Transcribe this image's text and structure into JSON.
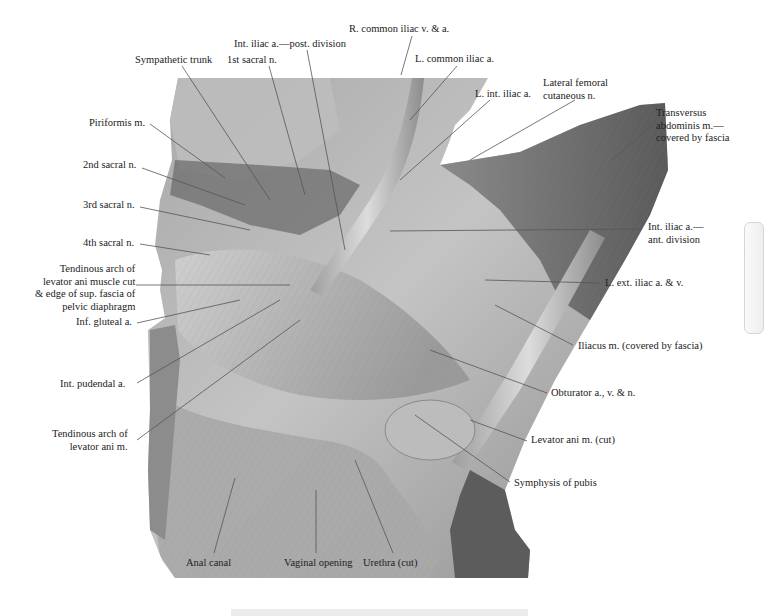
{
  "figure": {
    "colors": {
      "background": "#ffffff",
      "specimen_light": "#cfcfcf",
      "specimen_mid": "#9c9c9c",
      "specimen_dark": "#4a4a4a",
      "leader_line": "#555555",
      "label_text": "#222222",
      "side_tab_border": "#d6d6d6",
      "bottom_bar": "#ececec"
    }
  },
  "labels": [
    {
      "id": "r-common-iliac",
      "text": "R. common iliac v. & a.",
      "x": 349,
      "y": 23,
      "align": "left",
      "line": [
        [
          412,
          36
        ],
        [
          401,
          75
        ]
      ]
    },
    {
      "id": "int-iliac-post",
      "text": "Int. iliac a.—post. division",
      "x": 234,
      "y": 38,
      "align": "left",
      "line": [
        [
          307,
          50
        ],
        [
          345,
          250
        ]
      ]
    },
    {
      "id": "sympathetic-trunk",
      "text": "Sympathetic trunk",
      "x": 135,
      "y": 54,
      "align": "left",
      "line": [
        [
          182,
          66
        ],
        [
          270,
          200
        ]
      ]
    },
    {
      "id": "1st-sacral",
      "text": "1st sacral n.",
      "x": 227,
      "y": 54,
      "align": "left",
      "line": [
        [
          269,
          66
        ],
        [
          305,
          195
        ]
      ]
    },
    {
      "id": "l-common-iliac",
      "text": "L. common iliac a.",
      "x": 415,
      "y": 53,
      "align": "left",
      "line": [
        [
          457,
          66
        ],
        [
          410,
          120
        ]
      ]
    },
    {
      "id": "lat-femoral-cut",
      "text": "Lateral femoral\ncutaneous n.",
      "x": 543,
      "y": 77,
      "align": "left",
      "line": [
        [
          575,
          100
        ],
        [
          470,
          160
        ]
      ]
    },
    {
      "id": "l-int-iliac",
      "text": "L. int. iliac a.",
      "x": 475,
      "y": 88,
      "align": "left",
      "line": [
        [
          490,
          100
        ],
        [
          400,
          180
        ]
      ]
    },
    {
      "id": "transversus",
      "text": "Transversus\nabdominis m.—\ncovered by fascia",
      "x": 656,
      "y": 107,
      "align": "left",
      "line": [
        [
          652,
          125
        ],
        [
          612,
          160
        ]
      ]
    },
    {
      "id": "piriformis",
      "text": "Piriformis m.",
      "x": 89,
      "y": 117,
      "align": "right",
      "line": [
        [
          150,
          124
        ],
        [
          225,
          178
        ]
      ]
    },
    {
      "id": "2nd-sacral",
      "text": "2nd sacral n.",
      "x": 83,
      "y": 159,
      "align": "right",
      "line": [
        [
          142,
          168
        ],
        [
          245,
          205
        ]
      ]
    },
    {
      "id": "3rd-sacral",
      "text": "3rd sacral n.",
      "x": 83,
      "y": 199,
      "align": "right",
      "line": [
        [
          140,
          207
        ],
        [
          250,
          230
        ]
      ]
    },
    {
      "id": "4th-sacral",
      "text": "4th sacral n.",
      "x": 83,
      "y": 237,
      "align": "right",
      "line": [
        [
          140,
          244
        ],
        [
          210,
          255
        ]
      ]
    },
    {
      "id": "int-iliac-ant",
      "text": "Int. iliac a.—\nant. division",
      "x": 648,
      "y": 221,
      "align": "left",
      "line": [
        [
          642,
          229
        ],
        [
          390,
          231
        ]
      ]
    },
    {
      "id": "tendinous-arch-cut",
      "text": "Tendinous arch of\nlevator ani muscle cut\n& edge of sup. fascia of\npelvic diaphragm",
      "x": 35,
      "y": 263,
      "align": "right",
      "line": [
        [
          136,
          285
        ],
        [
          290,
          285
        ]
      ]
    },
    {
      "id": "l-ext-iliac",
      "text": "L. ext. iliac a. & v.",
      "x": 605,
      "y": 277,
      "align": "left",
      "line": [
        [
          600,
          283
        ],
        [
          485,
          280
        ]
      ]
    },
    {
      "id": "inf-gluteal",
      "text": "Inf. gluteal a.",
      "x": 76,
      "y": 316,
      "align": "right",
      "line": [
        [
          137,
          323
        ],
        [
          240,
          300
        ]
      ]
    },
    {
      "id": "iliacus",
      "text": "Iliacus m. (covered by fascia)",
      "x": 578,
      "y": 340,
      "align": "left",
      "line": [
        [
          573,
          345
        ],
        [
          495,
          305
        ]
      ]
    },
    {
      "id": "int-pudendal",
      "text": "Int. pudendal a.",
      "x": 60,
      "y": 378,
      "align": "right",
      "line": [
        [
          137,
          383
        ],
        [
          280,
          300
        ]
      ]
    },
    {
      "id": "obturator",
      "text": "Obturator a., v. & n.",
      "x": 551,
      "y": 387,
      "align": "left",
      "line": [
        [
          547,
          393
        ],
        [
          430,
          350
        ]
      ]
    },
    {
      "id": "tendinous-arch",
      "text": "Tendinous arch of\nlevator ani m.",
      "x": 52,
      "y": 428,
      "align": "right",
      "line": [
        [
          137,
          440
        ],
        [
          300,
          320
        ]
      ]
    },
    {
      "id": "levator-ani-cut",
      "text": "Levator ani m. (cut)",
      "x": 531,
      "y": 434,
      "align": "left",
      "line": [
        [
          527,
          441
        ],
        [
          470,
          420
        ]
      ]
    },
    {
      "id": "symphysis",
      "text": "Symphysis of pubis",
      "x": 514,
      "y": 477,
      "align": "left",
      "line": [
        [
          510,
          482
        ],
        [
          415,
          415
        ]
      ]
    },
    {
      "id": "anal-canal",
      "text": "Anal canal",
      "x": 186,
      "y": 557,
      "align": "left",
      "line": [
        [
          214,
          553
        ],
        [
          235,
          478
        ]
      ]
    },
    {
      "id": "vaginal-opening",
      "text": "Vaginal opening",
      "x": 284,
      "y": 557,
      "align": "left",
      "line": [
        [
          316,
          553
        ],
        [
          316,
          490
        ]
      ]
    },
    {
      "id": "urethra",
      "text": "Urethra (cut)",
      "x": 363,
      "y": 557,
      "align": "left",
      "line": [
        [
          393,
          553
        ],
        [
          355,
          460
        ]
      ]
    }
  ],
  "side_tab": {
    "visible": true
  },
  "bottom_bar": {
    "visible": true
  }
}
